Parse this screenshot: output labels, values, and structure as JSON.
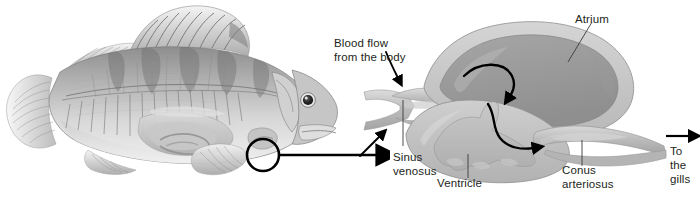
{
  "figure": {
    "background_color": "#ffffff",
    "text_color": "#231f20"
  },
  "fish": {
    "name": "perch-fish-lateral-cutaway",
    "heart_highlight_circle": "heart-location-circle"
  },
  "connector": {
    "name": "magnification-arrow"
  },
  "labels": {
    "blood_flow": "Blood flow\nfrom the body",
    "atrium": "Atrium",
    "sinus_venosus": "Sinus\nvenosus",
    "ventricle": "Ventricle",
    "conus_arteriosus": "Conus\narteriosus",
    "to_the_gills": "To\nthe\ngills"
  },
  "heart": {
    "chambers": [
      "sinus venosus",
      "atrium",
      "ventricle",
      "conus arteriosus"
    ],
    "flow_arrows": [
      "atrium-to-ventricle-arrow",
      "ventricle-to-conus-arrow",
      "inflow-arrow-upper",
      "inflow-arrow-lower",
      "outflow-arrow-to-gills"
    ],
    "colors": {
      "wall_light": "#cccccc",
      "wall_mid": "#b3b3b3",
      "cavity_dark": "#9d9d9d",
      "tissue": "#bdbdbd",
      "outline": "#1a1a1a"
    }
  }
}
